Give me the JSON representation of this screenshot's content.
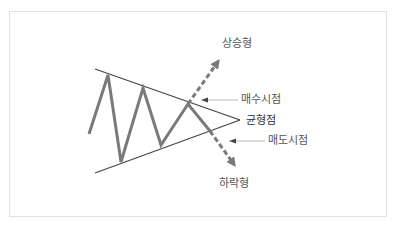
{
  "diagram": {
    "labels": {
      "breakout_up": "상승형",
      "buy_point": "매수시점",
      "equilibrium": "균형점",
      "sell_point": "매도시점",
      "breakout_down": "하락형"
    },
    "colors": {
      "price_line": "#7a7a7a",
      "trend_lines": "#444444",
      "dashed_arrows": "#7a7a7a",
      "pointer_lines": "#aaaaaa",
      "label_text": "#555555",
      "frame_border": "#e2e2e2"
    }
  }
}
